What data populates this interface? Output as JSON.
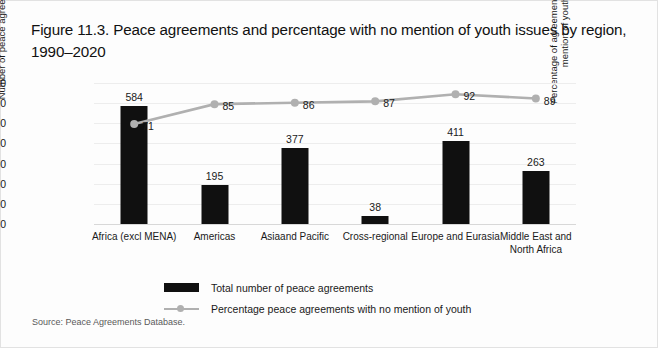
{
  "figure": {
    "title": "Figure 11.3.  Peace agreements and percentage with no mention of youth issues by region, 1990–2020",
    "source": "Source: Peace Agreements Database."
  },
  "legend": {
    "items": [
      {
        "label": "Total number of peace agreements",
        "marker": "bar-swatch",
        "color": "#101010"
      },
      {
        "label": "Percentage peace agreements with no mention of youth",
        "marker": "line-swatch",
        "color": "#b0b0b0"
      }
    ]
  },
  "chart_data": {
    "type": "bar",
    "title": "Figure 11.3.  Peace agreements and percentage with no mention of youth issues by region, 1990–2020",
    "categories": [
      "Africa (excl MENA)",
      "Americas",
      "Asiaand Pacific",
      "Cross-regional",
      "Europe and Eurasia",
      "Middle East and North Africa"
    ],
    "series": [
      {
        "name": "Total number of peace agreements",
        "type": "bar",
        "axis": "left",
        "color": "#101010",
        "values": [
          584,
          195,
          377,
          38,
          411,
          263
        ]
      },
      {
        "name": "Percentage peace agreements with no mention of youth",
        "type": "line",
        "axis": "right",
        "color": "#b0b0b0",
        "values": [
          71,
          85,
          86,
          87,
          92,
          89
        ]
      }
    ],
    "xlabel": "",
    "ylabel": "Number of peace agreements",
    "ylabel_right": "Percentage of agreements with no mention of youth",
    "ylim": [
      0,
      700
    ],
    "yticks": [
      0,
      100,
      200,
      300,
      400,
      500,
      600,
      700
    ],
    "ylim_right": [
      0,
      100
    ],
    "yticks_right": [
      0,
      10,
      20,
      30,
      40,
      50,
      60,
      70,
      80,
      90,
      100
    ],
    "grid": true,
    "legend_position": "bottom"
  }
}
